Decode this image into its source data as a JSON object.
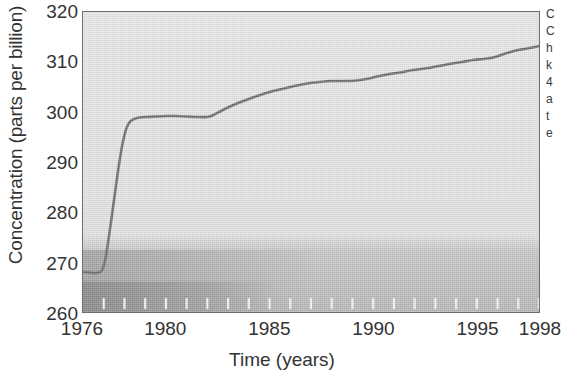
{
  "chart_data": {
    "type": "line",
    "title": "",
    "xlabel": "Time (years)",
    "ylabel": "Concentration (parts per billion)",
    "xlim": [
      1976,
      1998
    ],
    "ylim": [
      260,
      320
    ],
    "grid": false,
    "legend": null,
    "x_ticklabels": [
      "1976",
      "1980",
      "1985",
      "1990",
      "1995",
      "1998"
    ],
    "x_tickvalues": [
      1976,
      1980,
      1985,
      1990,
      1995,
      1998
    ],
    "y_ticklabels": [
      "260",
      "270",
      "280",
      "290",
      "300",
      "310",
      "320"
    ],
    "y_tickvalues": [
      260,
      270,
      280,
      290,
      300,
      310,
      320
    ],
    "x_minor_ticks": [
      1977,
      1978,
      1979,
      1980,
      1981,
      1982,
      1983,
      1984,
      1985,
      1986,
      1987,
      1988,
      1989,
      1990,
      1991,
      1992,
      1993,
      1994,
      1995,
      1996,
      1997,
      1998
    ],
    "line_color": "#6b6b6b",
    "plot_bg_color": "#e3e3e3",
    "axis_color": "#6e6e6e",
    "series": [
      {
        "name": "Concentration",
        "x": [
          1976.0,
          1976.3,
          1976.6,
          1976.9,
          1977.1,
          1977.3,
          1977.5,
          1977.7,
          1977.9,
          1978.1,
          1978.3,
          1978.6,
          1979.0,
          1979.5,
          1980.0,
          1980.5,
          1981.0,
          1981.5,
          1982.0,
          1982.3,
          1982.7,
          1983.2,
          1983.8,
          1984.4,
          1985.0,
          1985.6,
          1986.2,
          1986.8,
          1987.4,
          1988.0,
          1988.6,
          1989.2,
          1989.8,
          1990.3,
          1990.8,
          1991.3,
          1991.8,
          1992.3,
          1992.8,
          1993.3,
          1993.8,
          1994.3,
          1994.8,
          1995.3,
          1995.8,
          1996.3,
          1996.8,
          1997.3,
          1997.8,
          1998.0
        ],
        "y": [
          268.0,
          267.9,
          267.8,
          268.2,
          271.0,
          276.5,
          282.5,
          288.5,
          293.5,
          296.8,
          298.2,
          298.8,
          299.0,
          299.1,
          299.2,
          299.2,
          299.1,
          299.0,
          299.0,
          299.4,
          300.3,
          301.3,
          302.3,
          303.2,
          304.0,
          304.6,
          305.2,
          305.7,
          306.0,
          306.2,
          306.2,
          306.3,
          306.7,
          307.2,
          307.6,
          307.9,
          308.3,
          308.6,
          308.9,
          309.3,
          309.7,
          310.0,
          310.4,
          310.6,
          310.9,
          311.6,
          312.2,
          312.6,
          313.0,
          313.2
        ]
      }
    ]
  },
  "axes": {
    "y_title": "Concentration (parts per billion)",
    "x_title": "Time (years)"
  },
  "right_caption_fragment": "C\nC\nh\nk\n4\na\nt\ne"
}
